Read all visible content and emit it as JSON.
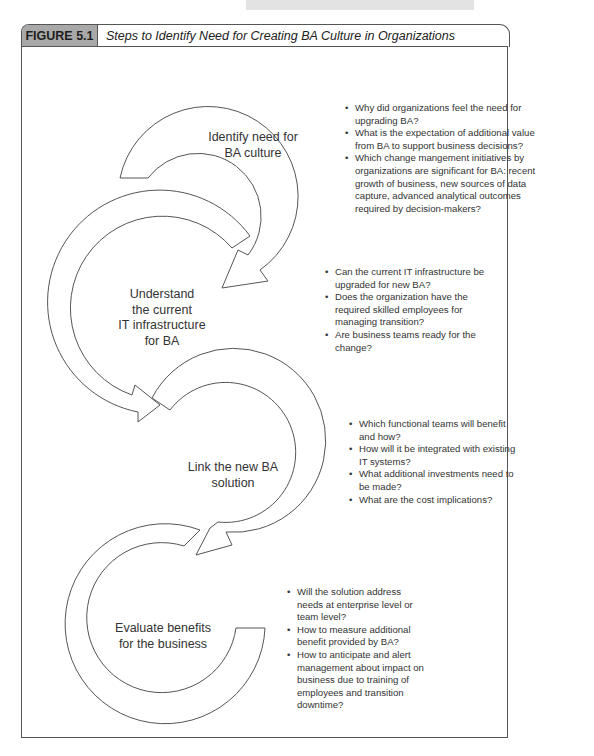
{
  "figure": {
    "label": "FIGURE 5.1",
    "title": "Steps to Identify Need for Creating BA Culture in Organizations"
  },
  "steps": [
    {
      "label_lines": [
        "Identify need for",
        "BA culture"
      ],
      "questions": [
        "Why did organizations feel the need for upgrading BA?",
        "What is the expectation of additional value from BA to support business decisions?",
        "Which change mangement initiatives by organizations are significant for BA: recent growth of business, new sources of data capture, advanced analytical outcomes required by decision-makers?"
      ]
    },
    {
      "label_lines": [
        "Understand",
        "the current",
        "IT infrastructure",
        "for BA"
      ],
      "questions": [
        "Can the current IT infrastructure be upgraded for new BA?",
        "Does the organization have the required skilled employees for managing transition?",
        "Are business teams ready for the change?"
      ]
    },
    {
      "label_lines": [
        "Link the new BA",
        "solution"
      ],
      "questions": [
        "Which functional teams will benefit and how?",
        "How will it be integrated with existing IT systems?",
        "What additional investments need to be made?",
        "What are the cost implications?"
      ]
    },
    {
      "label_lines": [
        "Evaluate benefits",
        "for the business"
      ],
      "questions": [
        "Will the solution address needs at enterprise level or team level?",
        "How to measure additional benefit provided by BA?",
        "How to anticipate and alert management about impact on business due to training of employees and transition downtime?"
      ]
    }
  ],
  "colors": {
    "label_bg": "#a9a9a9",
    "stroke": "#555555",
    "text": "#333333"
  }
}
